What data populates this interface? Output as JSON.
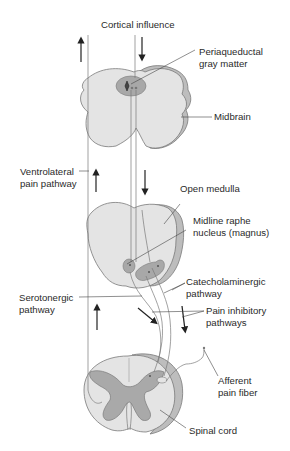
{
  "diagram": {
    "type": "anatomical-pathway",
    "colors": {
      "tissue_fill": "#e4e4e4",
      "tissue_outline": "#7a7a7a",
      "rim_fill": "#bdbdbd",
      "nucleus_fill": "#a8a8a8",
      "gray_matter_fill": "#a9a9a9",
      "line": "#444444",
      "text": "#2a2a2a",
      "background": "#ffffff"
    },
    "labels": {
      "cortical_influence": "Cortical influence",
      "periaqueductal": [
        "Periaqueductal",
        "gray matter"
      ],
      "midbrain": "Midbrain",
      "ventrolateral": [
        "Ventrolateral",
        "pain pathway"
      ],
      "open_medulla": "Open medulla",
      "midline_raphe": [
        "Midline raphe",
        "nucleus (magnus)"
      ],
      "catecholaminergic": [
        "Catecholaminergic",
        "pathway"
      ],
      "serotonergic": [
        "Serotonergic",
        "pathway"
      ],
      "pain_inhibitory": [
        "Pain inhibitory",
        "pathways"
      ],
      "afferent": [
        "Afferent",
        "pain fiber"
      ],
      "spinal_cord": "Spinal cord"
    },
    "structures": [
      "Midbrain",
      "Open medulla",
      "Spinal cord"
    ],
    "arrows": [
      {
        "location": "left of midbrain",
        "direction": "up"
      },
      {
        "location": "below cortical influence",
        "direction": "down"
      },
      {
        "location": "ventrolateral pathway",
        "direction": "up"
      },
      {
        "location": "between midbrain and medulla",
        "direction": "down"
      },
      {
        "location": "serotonergic pathway",
        "direction": "up"
      },
      {
        "location": "toward spinal cord",
        "direction": "down-right"
      },
      {
        "location": "pain inhibitory pathways",
        "direction": "down"
      }
    ]
  }
}
